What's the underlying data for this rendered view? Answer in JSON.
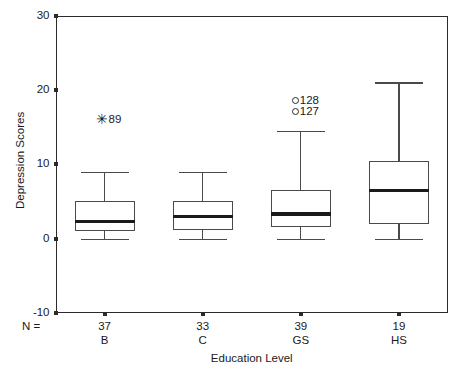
{
  "chart_data": {
    "type": "box",
    "title": "",
    "xlabel": "Education Level",
    "ylabel": "Depression Scores",
    "ylim": [
      -10,
      30
    ],
    "yticks": [
      30,
      20,
      10,
      0,
      -10
    ],
    "ytick_labels": [
      "30",
      "20",
      "10",
      "0",
      "-10"
    ],
    "grid": false,
    "legend": "none",
    "n_prefix": "N =",
    "categories": [
      "B",
      "C",
      "GS",
      "HS"
    ],
    "counts": [
      37,
      33,
      39,
      19
    ],
    "count_labels": [
      "37",
      "33",
      "39",
      "19"
    ],
    "boxes": [
      {
        "category": "B",
        "n": 37,
        "whisker_low": 0,
        "q1": 1,
        "median": 2.3,
        "q3": 5,
        "whisker_high": 9,
        "outliers": [
          {
            "value": 16,
            "label": "89",
            "marker": "star"
          }
        ]
      },
      {
        "category": "C",
        "n": 33,
        "whisker_low": 0,
        "q1": 1.2,
        "median": 3,
        "q3": 5,
        "whisker_high": 9,
        "outliers": []
      },
      {
        "category": "GS",
        "n": 39,
        "whisker_low": 0,
        "q1": 1.5,
        "median": 3.3,
        "q3": 6.5,
        "whisker_high": 14.5,
        "outliers": [
          {
            "value": 18.5,
            "label": "128",
            "marker": "circle"
          },
          {
            "value": 17,
            "label": "127",
            "marker": "circle"
          }
        ]
      },
      {
        "category": "HS",
        "n": 19,
        "whisker_low": 0,
        "q1": 2,
        "median": 6.5,
        "q3": 10.5,
        "whisker_high": 21,
        "outliers": []
      }
    ],
    "colors": {
      "axis": "#2b2b2b",
      "box_outline": "#4a4a4a",
      "median": "#1a1a1a",
      "text": "#1a1a1a",
      "background": "#ffffff"
    }
  }
}
